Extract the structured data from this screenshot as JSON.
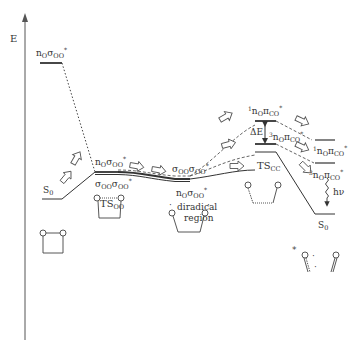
{
  "axis": {
    "label": "E"
  },
  "states": {
    "left_excited": {
      "main": "n",
      "sub1": "O",
      "main2": "σ",
      "sub2": "OO",
      "sup": "*"
    },
    "S0_left": {
      "main": "S",
      "sub": "0"
    },
    "ts_oo_upper": {
      "main": "n",
      "sub1": "O",
      "main2": "σ",
      "sub2": "OO",
      "sup": "*"
    },
    "ts_oo_lower": {
      "main": "σ",
      "sub1": "OO",
      "main2": "σ",
      "sub2": "OO",
      "sup": "*"
    },
    "ts_oo_name": {
      "main": "TS",
      "sub": "OO"
    },
    "diradical_upper": {
      "main": "σ",
      "sub1": "OO",
      "main2": "σ",
      "sub2": "OO",
      "sup": "*"
    },
    "diradical_lower": {
      "main": "n",
      "sub1": "O",
      "main2": "σ",
      "sub2": "OO",
      "sup": "*"
    },
    "diradical_text1": "diradical",
    "diradical_text2": "region",
    "singlet_top": {
      "pre": "1",
      "main": "n",
      "sub1": "O",
      "main2": "π",
      "sub2": "CO",
      "sup": "*"
    },
    "delta_e": "ΔE",
    "triplet_mid": {
      "pre": "3",
      "main": "n",
      "sub1": "O",
      "main2": "π",
      "sub2": "CO",
      "sup": "*"
    },
    "ts_cc_name": {
      "main": "TS",
      "sub": "CC"
    },
    "singlet_right": {
      "pre": "1",
      "main": "n",
      "sub1": "O",
      "main2": "π",
      "sub2": "CO",
      "sup": "*"
    },
    "triplet_right": {
      "pre": "3",
      "main": "n",
      "sub1": "O",
      "main2": "π",
      "sub2": "CO",
      "sup": "*"
    },
    "hv": "hν",
    "S0_right": {
      "main": "S",
      "sub": "0"
    }
  },
  "molecules": {
    "atom": "O",
    "radical_dot": "·",
    "excited_star": "*"
  },
  "colors": {
    "line": "#333333",
    "arrow_fill": "#ffffff",
    "text": "#333333"
  }
}
